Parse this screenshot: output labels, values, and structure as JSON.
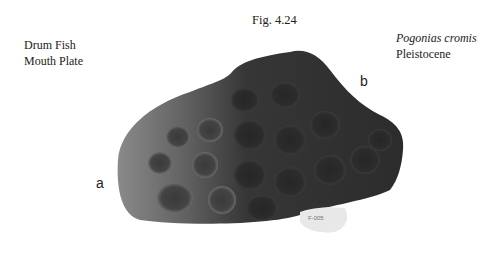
{
  "figure": {
    "number": "Fig. 4.24",
    "common_name": [
      "Drum Fish",
      "Mouth Plate"
    ],
    "scientific_name": "Pogonias cromis",
    "epoch": "Pleistocene"
  },
  "annotations": {
    "a": "a",
    "b": "b"
  },
  "specimen": {
    "description": "fossil mouth plate photograph",
    "colors": {
      "dark": "#2e2e2e",
      "mid": "#5a5a5a",
      "light": "#8a8a8a",
      "label_tag": "#e8e8e8"
    }
  }
}
